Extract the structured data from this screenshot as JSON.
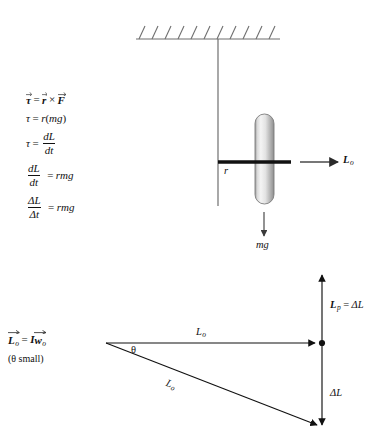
{
  "figure": {
    "background": "#ffffff",
    "ink": "#111111",
    "gray_line": "#8a8a8a",
    "wheel_light": "#f2f2f2",
    "wheel_dark": "#8e8e8e"
  },
  "equations": {
    "torque_vector": {
      "tau": "τ",
      "equals": "=",
      "r": "r",
      "cross": "×",
      "F": "F"
    },
    "torque_scalar": {
      "tau": "τ",
      "equals": "=",
      "rhs": "r",
      "paren_open": "(",
      "mg": "mg",
      "paren_close": ")"
    },
    "torque_rate": {
      "tau": "τ",
      "equals": "=",
      "num": "dL",
      "den": "dt"
    },
    "dldt": {
      "num": "dL",
      "den": "dt",
      "equals": "=",
      "rhs": "rmg"
    },
    "delta_l": {
      "num": "ΔL",
      "den": "Δt",
      "equals": "=",
      "rhs": "rmg"
    }
  },
  "momentum_label": {
    "L": "L",
    "L_sub": "o",
    "equals": "=",
    "I": "I",
    "w": "w",
    "w_sub": "o",
    "note": "(θ small)"
  },
  "top_figure": {
    "ceiling_hatch_count": 11,
    "radius_label": "r",
    "weight_label": "mg",
    "angular_momentum": {
      "L": "L",
      "sub": "o"
    }
  },
  "vector_triangle": {
    "horizontal_label": {
      "L": "L",
      "sub": "o"
    },
    "hypotenuse_label": {
      "L": "L",
      "sub": "o"
    },
    "angle_label": "θ",
    "precession_label": {
      "L": "L",
      "sub": "p",
      "equals": "=",
      "delta": "ΔL"
    },
    "delta_label": "ΔL"
  }
}
